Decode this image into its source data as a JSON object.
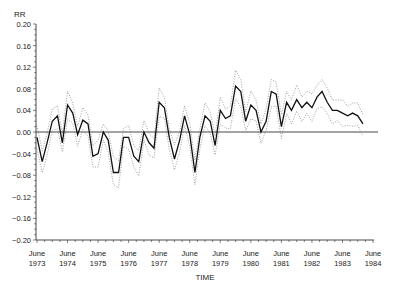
{
  "chart_data": {
    "type": "line",
    "title": "",
    "xlabel": "TIME",
    "ylabel": "RR",
    "ylim": [
      -0.2,
      0.2
    ],
    "xlim": [
      "June 1973",
      "June 1984"
    ],
    "grid": false,
    "legend": null,
    "y_ticks": [
      "0.20",
      "0.16",
      "0.12",
      "0.08",
      "0.04",
      "0.00",
      "-0.04",
      "-0.08",
      "-0.12",
      "-0.16",
      "-0.20"
    ],
    "x_ticks": [
      {
        "month": "June",
        "year": "1973"
      },
      {
        "month": "June",
        "year": "1974"
      },
      {
        "month": "June",
        "year": "1975"
      },
      {
        "month": "June",
        "year": "1976"
      },
      {
        "month": "June",
        "year": "1977"
      },
      {
        "month": "June",
        "year": "1978"
      },
      {
        "month": "June",
        "year": "1979"
      },
      {
        "month": "June",
        "year": "1980"
      },
      {
        "month": "June",
        "year": "1981"
      },
      {
        "month": "June",
        "year": "1982"
      },
      {
        "month": "June",
        "year": "1983"
      },
      {
        "month": "June",
        "year": "1984"
      }
    ],
    "reference_line": {
      "y": 0.0,
      "style": "solid"
    },
    "x_unit": "years since June 1973",
    "series": [
      {
        "name": "RR estimate",
        "style": "solid",
        "x": [
          0.0,
          0.17,
          0.33,
          0.5,
          0.67,
          0.83,
          1.0,
          1.17,
          1.33,
          1.5,
          1.67,
          1.83,
          2.0,
          2.17,
          2.33,
          2.5,
          2.67,
          2.83,
          3.0,
          3.17,
          3.33,
          3.5,
          3.67,
          3.83,
          4.0,
          4.17,
          4.33,
          4.5,
          4.67,
          4.83,
          5.0,
          5.17,
          5.33,
          5.5,
          5.67,
          5.83,
          6.0,
          6.17,
          6.33,
          6.5,
          6.67,
          6.83,
          7.0,
          7.17,
          7.33,
          7.5,
          7.67,
          7.83,
          8.0,
          8.17,
          8.33,
          8.5,
          8.67,
          8.83,
          9.0,
          9.17,
          9.33,
          9.5,
          9.67,
          9.83,
          10.0,
          10.17,
          10.33,
          10.5,
          10.67
        ],
        "values": [
          -0.01,
          -0.055,
          -0.02,
          0.02,
          0.03,
          -0.02,
          0.05,
          0.035,
          -0.005,
          0.022,
          0.015,
          -0.045,
          -0.04,
          0.0,
          -0.015,
          -0.075,
          -0.075,
          -0.01,
          -0.01,
          -0.045,
          -0.055,
          0.0,
          -0.02,
          -0.03,
          0.055,
          0.045,
          -0.01,
          -0.05,
          -0.015,
          0.03,
          -0.005,
          -0.075,
          -0.01,
          0.03,
          0.02,
          -0.025,
          0.04,
          0.025,
          0.03,
          0.085,
          0.075,
          0.02,
          0.05,
          0.04,
          0.0,
          0.02,
          0.075,
          0.07,
          0.01,
          0.055,
          0.04,
          0.06,
          0.045,
          0.055,
          0.045,
          0.065,
          0.075,
          0.055,
          0.04,
          0.04,
          0.035,
          0.03,
          0.035,
          0.03,
          0.015
        ]
      },
      {
        "name": "Upper confidence bound",
        "style": "dotted",
        "offset": 0.015
      },
      {
        "name": "Lower confidence bound",
        "style": "dotted",
        "offset": -0.015
      }
    ]
  }
}
